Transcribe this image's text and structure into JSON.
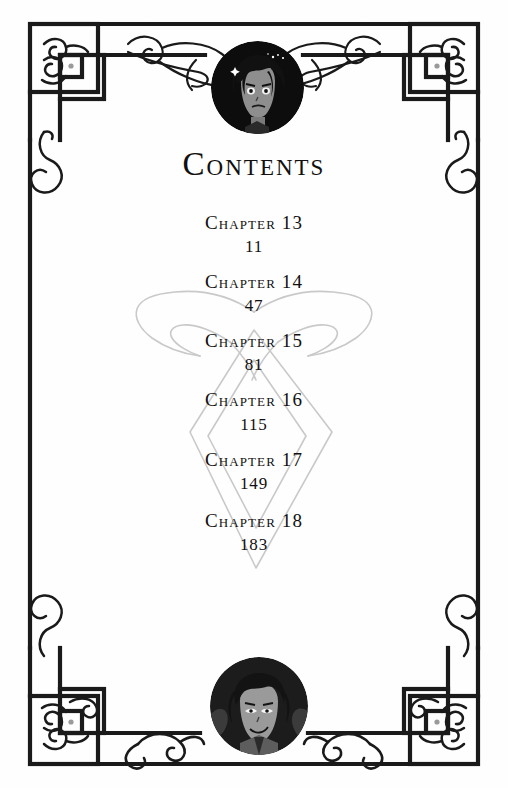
{
  "page": {
    "title": "Contents",
    "background_color": "#ffffff",
    "ink_color": "#12100f",
    "watermark_color": "#c9c9c9"
  },
  "header": {
    "title": "Contents"
  },
  "contents": {
    "entries": [
      {
        "chapter": "Chapter 13",
        "page": "11"
      },
      {
        "chapter": "Chapter 14",
        "page": "47"
      },
      {
        "chapter": "Chapter 15",
        "page": "81"
      },
      {
        "chapter": "Chapter 16",
        "page": "115"
      },
      {
        "chapter": "Chapter 17",
        "page": "149"
      },
      {
        "chapter": "Chapter 18",
        "page": "183"
      }
    ]
  },
  "decorations": {
    "watermark": "angelic-power-rune",
    "frame": "interlocking-square-celtic-border",
    "corner_dot_color": "#9a9a9a",
    "flourishes": "scrollwork-filigree"
  },
  "portraits": [
    {
      "position": "top",
      "name": "dark-haired-character-portrait"
    },
    {
      "position": "bottom",
      "name": "smiling-character-portrait"
    }
  ]
}
